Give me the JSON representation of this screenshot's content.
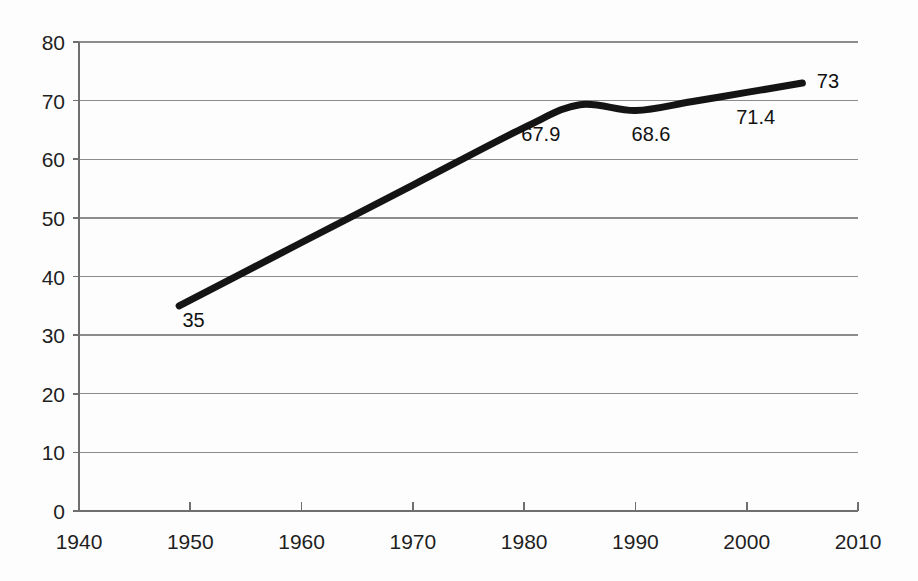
{
  "chart_data": {
    "type": "line",
    "title": "",
    "subtitle": "",
    "xlabel": "",
    "ylabel": "",
    "xlim": [
      1940,
      2010
    ],
    "ylim": [
      0,
      80
    ],
    "grid": true,
    "legend": false,
    "legend_position": "none",
    "x_ticks": [
      "1940",
      "1950",
      "1960",
      "1970",
      "1980",
      "1990",
      "2000",
      "2010"
    ],
    "x_tick_values": [
      1940,
      1950,
      1960,
      1970,
      1980,
      1990,
      2000,
      2010
    ],
    "y_ticks": [
      "0",
      "10",
      "20",
      "30",
      "40",
      "50",
      "60",
      "70",
      "80"
    ],
    "y_tick_values": [
      0,
      10,
      20,
      30,
      40,
      50,
      60,
      70,
      80
    ],
    "series": [
      {
        "name": "value",
        "color": "#141414",
        "x": [
          1949,
          1960,
          1970,
          1980,
          1985,
          1990,
          1995,
          2000,
          2005
        ],
        "values": [
          35,
          45.8,
          55.6,
          65.4,
          69.3,
          68.3,
          69.8,
          71.4,
          73
        ]
      }
    ],
    "data_labels": [
      {
        "text": "35",
        "x": 1950.3,
        "y": 31.4
      },
      {
        "text": "67.9",
        "x": 1981.5,
        "y": 63.1
      },
      {
        "text": "68.6",
        "x": 1991.4,
        "y": 63.1
      },
      {
        "text": "71.4",
        "x": 2000.8,
        "y": 66.0
      },
      {
        "text": "73",
        "x": 2007.3,
        "y": 72.2
      }
    ]
  },
  "colors": {
    "series": "#141414",
    "gridline": "#8c8c8c",
    "axis": "#6f6f6f",
    "text": "#1f1f1f",
    "background": "#fdfdfd"
  }
}
